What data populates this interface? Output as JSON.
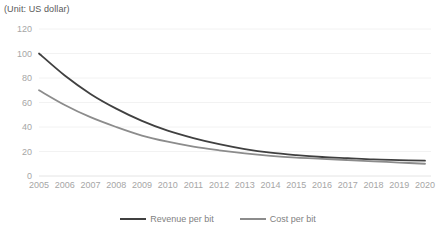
{
  "unit_note": "(Unit: US dollar)",
  "legend": {
    "position": "bottom-center",
    "entries": [
      {
        "label": "Revenue per bit",
        "color": "#404040"
      },
      {
        "label": "Cost per bit",
        "color": "#8c8c8c"
      }
    ]
  },
  "chart_data": {
    "type": "line",
    "title": "",
    "subtitle": "",
    "annotation": "(Unit: US dollar)",
    "xlabel": "",
    "ylabel": "",
    "ylim": [
      0,
      120
    ],
    "ytick_values": [
      0,
      20,
      40,
      60,
      80,
      100,
      120
    ],
    "ytick_labels": [
      "0",
      "20",
      "40",
      "60",
      "80",
      "100",
      "120"
    ],
    "grid": true,
    "legend_position": "bottom-center",
    "categories": [
      "2005",
      "2006",
      "2007",
      "2008",
      "2009",
      "2010",
      "2011",
      "2012",
      "2013",
      "2014",
      "2015",
      "2016",
      "2017",
      "2018",
      "2019",
      "2020"
    ],
    "series": [
      {
        "name": "Revenue per bit",
        "color": "#404040",
        "values": [
          100,
          82,
          67,
          55,
          45,
          37,
          31,
          26,
          22,
          19,
          17,
          15.5,
          14.5,
          13.5,
          13,
          12.5
        ]
      },
      {
        "name": "Cost per bit",
        "color": "#8c8c8c",
        "values": [
          70,
          58,
          48,
          40,
          33,
          28,
          24,
          21,
          18.5,
          16.5,
          15,
          14,
          13,
          12,
          11,
          10
        ]
      }
    ]
  }
}
